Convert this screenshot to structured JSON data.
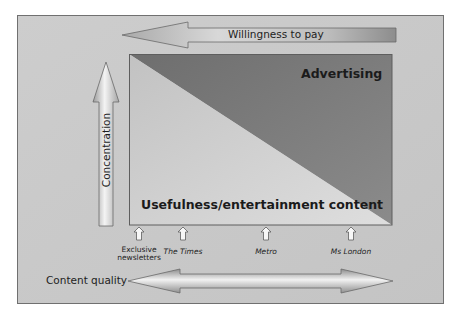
{
  "diagram": {
    "top_arrow": {
      "label": "Willingness to pay",
      "direction": "left"
    },
    "side_arrow": {
      "label": "Concentration",
      "direction": "up"
    },
    "bottom_arrow": {
      "label": "Content quality",
      "direction": "both"
    },
    "regions": {
      "upper": {
        "label": "Advertising",
        "color": "#7f7f7f"
      },
      "lower": {
        "label": "Usefulness/entertainment content",
        "color": "#cfcfcf"
      }
    },
    "publications": [
      {
        "line1": "Exclusive",
        "line2": "newsletters",
        "x": 139
      },
      {
        "label": "The Times",
        "x": 183
      },
      {
        "label": "Metro",
        "x": 266
      },
      {
        "label": "Ms London",
        "x": 351
      }
    ],
    "colors": {
      "background": "#c8c8c8",
      "frame": "#707070",
      "arrow_dark": "#8a8a8a",
      "arrow_light": "#ececec"
    }
  }
}
